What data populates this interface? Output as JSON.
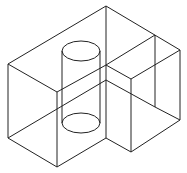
{
  "diagram": {
    "type": "isometric-wireframe",
    "stroke_color": "#222222",
    "background": "#ffffff"
  }
}
